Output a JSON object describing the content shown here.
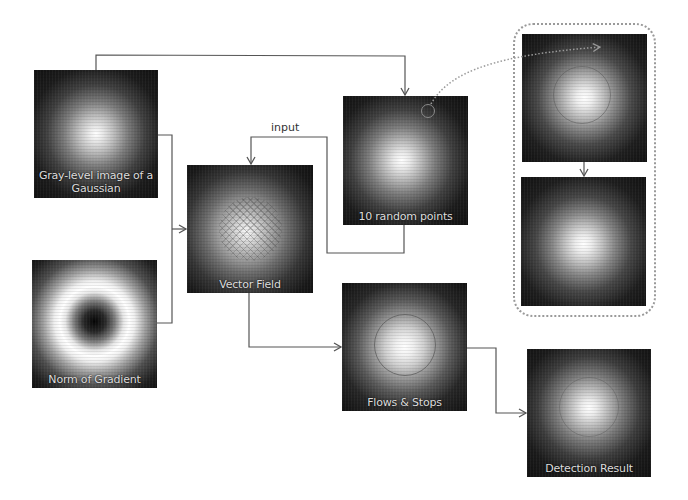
{
  "diagram": {
    "nodes": [
      {
        "id": "gaussian",
        "caption": "Gray-level image of a Gaussian",
        "caption_line1": "Gray-level image of a",
        "caption_line2": "Gaussian"
      },
      {
        "id": "norm_gradient",
        "caption": "Norm of Gradient"
      },
      {
        "id": "vector_field",
        "caption": "Vector Field"
      },
      {
        "id": "random_points",
        "caption": "10 random points"
      },
      {
        "id": "flows_stops",
        "caption": "Flows & Stops"
      },
      {
        "id": "detection_result",
        "caption": "Detection Result"
      },
      {
        "id": "zoom_detail_top",
        "caption": ""
      },
      {
        "id": "zoom_detail_bottom",
        "caption": ""
      }
    ],
    "edges": [
      {
        "from": "gaussian",
        "to": "random_points"
      },
      {
        "from": "gaussian",
        "to": "vector_field"
      },
      {
        "from": "norm_gradient",
        "to": "vector_field"
      },
      {
        "from": "random_points",
        "to": "vector_field",
        "label": "input"
      },
      {
        "from": "vector_field",
        "to": "flows_stops"
      },
      {
        "from": "flows_stops",
        "to": "detection_result"
      },
      {
        "from": "random_points",
        "to": "zoom_detail_top",
        "style": "dotted"
      },
      {
        "from": "zoom_detail_top",
        "to": "zoom_detail_bottom"
      }
    ],
    "edge_label_input": "input",
    "colors": {
      "line": "#555555",
      "dotted": "#9a9a9a",
      "panel_bg": "#111111",
      "caption": "#dcdcdc"
    }
  }
}
